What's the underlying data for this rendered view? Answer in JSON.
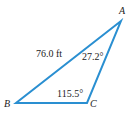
{
  "diagram": {
    "type": "triangle",
    "stroke_color": "#2a8fd1",
    "vertices": {
      "A": {
        "label": "A",
        "x": 121,
        "y": 21
      },
      "B": {
        "label": "B",
        "x": 16,
        "y": 103
      },
      "C": {
        "label": "C",
        "x": 87,
        "y": 103
      }
    },
    "labels": {
      "side_ab": "76.0 ft",
      "angle_a": "27.2°",
      "angle_c": "115.5°"
    }
  }
}
